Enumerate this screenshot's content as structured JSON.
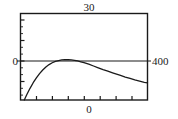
{
  "figure": {
    "background_color": "#ffffff",
    "line_color": "#1a1a1a",
    "frame_color": "#1a1a1a"
  },
  "labels": {
    "y_max": "30",
    "y_origin": "0",
    "x_max": "400",
    "x_origin": "0"
  },
  "chart_data": {
    "type": "line",
    "title": "",
    "xlabel": "0",
    "ylabel": "0",
    "annotations": [
      "30",
      "0",
      "400",
      "0"
    ],
    "grid": false,
    "legend": null,
    "xlim": [
      0,
      400
    ],
    "ylim": [
      -13,
      30
    ],
    "x_tick_labels": [
      "0",
      "400"
    ],
    "y_tick_labels": [
      "0",
      "30"
    ],
    "x_ticks": [
      0,
      50,
      100,
      150,
      200,
      250,
      300,
      350,
      400
    ],
    "y_ticks": [
      -10,
      0,
      10,
      20,
      30
    ],
    "zero_line_y": 0,
    "series": [
      {
        "name": "curve",
        "x": [
          12,
          20,
          30,
          40,
          50,
          60,
          70,
          80,
          90,
          100,
          110,
          120,
          130,
          140,
          150,
          160,
          170,
          180,
          190,
          200,
          215,
          230,
          245,
          260,
          275,
          290,
          300,
          315,
          330,
          345,
          360,
          375,
          390,
          400
        ],
        "y": [
          -13.0,
          -10.3,
          -7.2,
          -4.4,
          -2.0,
          0.1,
          1.9,
          3.4,
          4.6,
          5.5,
          6.2,
          6.6,
          6.9,
          7.0,
          7.0,
          6.9,
          6.7,
          6.4,
          6.0,
          5.6,
          4.8,
          3.9,
          3.0,
          2.1,
          1.3,
          0.5,
          0.0,
          -0.8,
          -1.6,
          -2.3,
          -3.0,
          -3.6,
          -4.2,
          -4.5
        ]
      }
    ]
  }
}
